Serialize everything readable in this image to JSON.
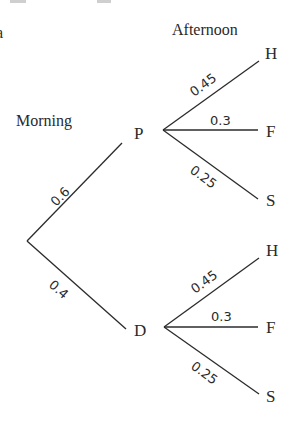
{
  "diagram": {
    "type": "probability-tree",
    "stage_labels": {
      "first": "Morning",
      "second": "Afternoon"
    },
    "cropped_fragment": "a",
    "root": {
      "branches": [
        {
          "node": "P",
          "probability": "0.6",
          "children": [
            {
              "node": "H",
              "probability": "0.45"
            },
            {
              "node": "F",
              "probability": "0.3"
            },
            {
              "node": "S",
              "probability": "0.25"
            }
          ]
        },
        {
          "node": "D",
          "probability": "0.4",
          "children": [
            {
              "node": "H",
              "probability": "0.45"
            },
            {
              "node": "F",
              "probability": "0.3"
            },
            {
              "node": "S",
              "probability": "0.25"
            }
          ]
        }
      ]
    }
  }
}
